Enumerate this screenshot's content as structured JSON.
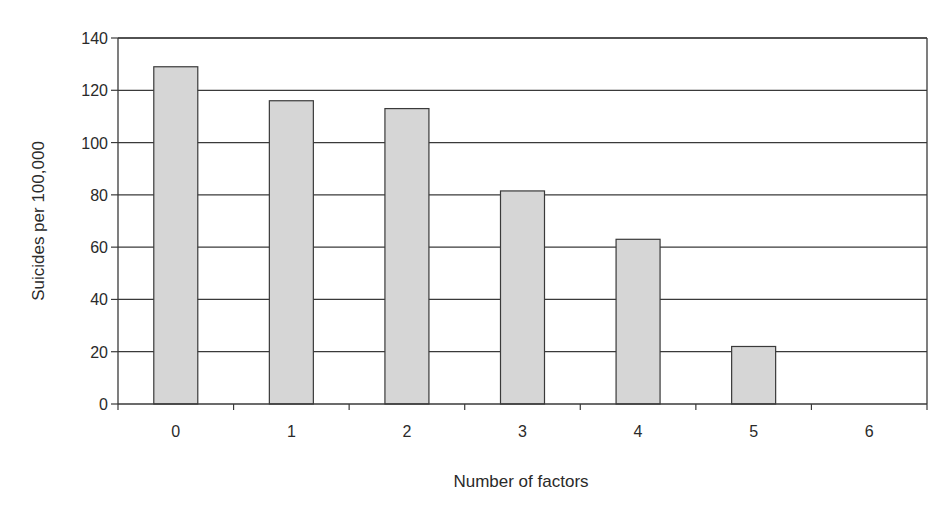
{
  "chart_data": {
    "type": "bar",
    "title": "",
    "xlabel": "Number of factors",
    "ylabel": "Suicides per 100,000",
    "categories": [
      "0",
      "1",
      "2",
      "3",
      "4",
      "5",
      "6"
    ],
    "values": [
      129,
      116,
      113,
      81.5,
      63,
      22,
      0
    ],
    "ylim": [
      0,
      140
    ],
    "yticks": [
      0,
      20,
      40,
      60,
      80,
      100,
      120,
      140
    ],
    "grid": true,
    "legend": null,
    "bar_color": "#d6d6d6",
    "bar_edge_color": "#3a3a3a",
    "grid_color": "#3a3a3a"
  }
}
